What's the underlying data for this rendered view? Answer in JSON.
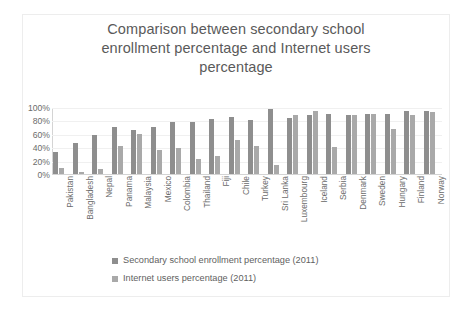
{
  "chart_data": {
    "type": "bar",
    "title": "Comparison between secondary school enrollment percentage and Internet users percentage",
    "title_lines": [
      "Comparison between secondary school",
      "enrollment percentage and Internet users",
      "percentage"
    ],
    "xlabel": "",
    "ylabel": "",
    "ylim": [
      0,
      100
    ],
    "ytick_labels": [
      "100%",
      "80%",
      "60%",
      "40%",
      "20%",
      "0%"
    ],
    "ytick_values": [
      100,
      80,
      60,
      40,
      20,
      0
    ],
    "grid": true,
    "legend_position": "bottom",
    "categories": [
      "Pakistan",
      "Bangladesh",
      "Nepal",
      "Panama",
      "Malaysia",
      "Mexico",
      "Colombia",
      "Thailand",
      "Fiji",
      "Chile",
      "Turkey",
      "Sri Lanka",
      "Luxembourg",
      "Iceland",
      "Serbia",
      "Denmark",
      "Sweden",
      "Hungary",
      "Finland",
      "Norway"
    ],
    "series": [
      {
        "name": "Secondary school enrollment percentage (2011)",
        "color": "#8e8e8e",
        "values": [
          35,
          48,
          60,
          72,
          67,
          72,
          79,
          79,
          84,
          87,
          82,
          99,
          85,
          90,
          91,
          89,
          91,
          91,
          96,
          96
        ]
      },
      {
        "name": "Internet users percentage (2011)",
        "color": "#a9a9a9",
        "values": [
          10,
          5,
          9,
          43,
          61,
          37,
          41,
          24,
          28,
          52,
          43,
          15,
          90,
          95,
          42,
          90,
          91,
          68,
          89,
          94
        ]
      }
    ]
  },
  "legend": {
    "items": [
      {
        "label": "Secondary school enrollment percentage (2011)",
        "color": "#8e8e8e"
      },
      {
        "label": "Internet users percentage (2011)",
        "color": "#a9a9a9"
      }
    ]
  }
}
